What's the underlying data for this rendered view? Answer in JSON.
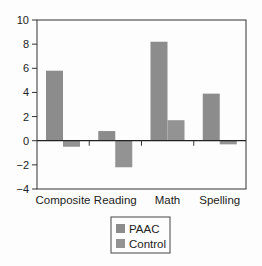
{
  "chart_data": {
    "type": "bar",
    "title": "",
    "xlabel": "",
    "ylabel": "",
    "categories": [
      "Composite",
      "Reading",
      "Math",
      "Spelling"
    ],
    "series": [
      {
        "name": "PAAC",
        "values": [
          5.8,
          0.8,
          8.2,
          3.9
        ],
        "color": "#8c8c8c"
      },
      {
        "name": "Control",
        "values": [
          -0.5,
          -2.2,
          1.7,
          -0.3
        ],
        "color": "#939393"
      }
    ],
    "ylim": [
      -4,
      10
    ],
    "yticks": [
      -4,
      -2,
      0,
      2,
      4,
      6,
      8,
      10
    ],
    "ytick_labels": [
      "−4",
      "−2",
      "0",
      "2",
      "4",
      "6",
      "8",
      "10"
    ],
    "grid": false,
    "legend_position": "bottom-center"
  }
}
